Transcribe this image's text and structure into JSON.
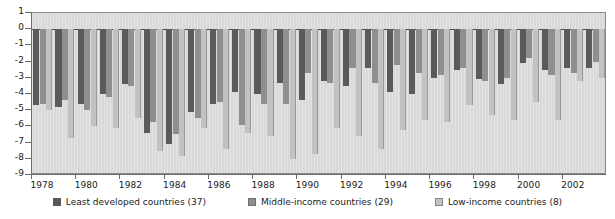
{
  "chart_data": {
    "type": "bar",
    "title": "",
    "subtitle": "",
    "xlabel": "",
    "ylabel": "",
    "ylim": [
      -9,
      1
    ],
    "yticks": [
      1,
      0,
      -1,
      -2,
      -3,
      -4,
      -5,
      -6,
      -7,
      -8,
      -9
    ],
    "ytick_labels": [
      "1",
      "0",
      "-1",
      "-2",
      "-3",
      "-4",
      "-5",
      "-6",
      "-7",
      "-8",
      "-9"
    ],
    "grid": false,
    "legend_position": "bottom",
    "orientation": "vertical",
    "categories": [
      "1978",
      "1979",
      "1980",
      "1981",
      "1982",
      "1983",
      "1984",
      "1985",
      "1986",
      "1987",
      "1988",
      "1989",
      "1990",
      "1991",
      "1992",
      "1993",
      "1994",
      "1995",
      "1996",
      "1997",
      "1998",
      "1999",
      "2000",
      "2001",
      "2002",
      "2003"
    ],
    "xtick_labels": [
      "1978",
      "1980",
      "1982",
      "1984",
      "1986",
      "1988",
      "1990",
      "1992",
      "1994",
      "1996",
      "1998",
      "2000",
      "2002"
    ],
    "series": [
      {
        "name": "Least developed countries (37)",
        "color": "#5a5a5a",
        "values": [
          -4.7,
          -4.8,
          -4.6,
          -4.0,
          -3.4,
          -6.4,
          -7.1,
          -5.1,
          -4.6,
          -3.9,
          -4.0,
          -3.3,
          -4.4,
          -3.2,
          -3.5,
          -2.4,
          -3.9,
          -4.0,
          -3.0,
          -2.5,
          -3.1,
          -3.4,
          -2.1,
          -2.5,
          -2.4,
          -2.4
        ]
      },
      {
        "name": "Middle-income countries (29)",
        "color": "#8f8f8f",
        "values": [
          -4.6,
          -4.4,
          -5.0,
          -4.2,
          -3.5,
          -5.7,
          -6.5,
          -5.5,
          -4.5,
          -5.9,
          -4.6,
          -4.6,
          -2.7,
          -3.3,
          -2.4,
          -3.3,
          -2.2,
          -2.7,
          -2.8,
          -2.4,
          -3.2,
          -3.0,
          -1.8,
          -2.8,
          -2.7,
          -2.0
        ]
      },
      {
        "name": "Low-income countries (8)",
        "color": "#c2c2c2",
        "values": [
          -5.0,
          -6.7,
          -6.0,
          -6.1,
          -5.5,
          -7.5,
          -7.8,
          -6.1,
          -7.4,
          -6.4,
          -6.6,
          -8.0,
          -7.7,
          -6.1,
          -6.6,
          -7.4,
          -6.2,
          -5.6,
          -5.7,
          -4.7,
          -5.3,
          -5.6,
          -4.5,
          -5.6,
          -3.2,
          -3.0
        ]
      }
    ]
  },
  "legend": {
    "items": [
      {
        "label": "Least developed countries (37)"
      },
      {
        "label": "Middle-income countries (29)"
      },
      {
        "label": "Low-income countries (8)"
      }
    ]
  }
}
